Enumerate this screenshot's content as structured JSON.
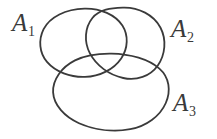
{
  "figure": {
    "type": "venn-diagram",
    "background_color": "#ffffff",
    "stroke_color": "#3a3a3a",
    "stroke_width": 1.8,
    "width": 217,
    "height": 139
  },
  "sets": [
    {
      "id": "A1",
      "base": "A",
      "subscript": "1",
      "label_position": "upper-left",
      "ellipse": {
        "cx": 84,
        "cy": 43,
        "rx": 43,
        "ry": 35,
        "rotation": -14
      }
    },
    {
      "id": "A2",
      "base": "A",
      "subscript": "2",
      "label_position": "upper-right",
      "ellipse": {
        "cx": 124,
        "cy": 42,
        "rx": 41,
        "ry": 36,
        "rotation": 20
      }
    },
    {
      "id": "A3",
      "base": "A",
      "subscript": "3",
      "label_position": "lower-right",
      "ellipse": {
        "cx": 111,
        "cy": 92,
        "rx": 58,
        "ry": 39,
        "rotation": -3
      }
    }
  ]
}
